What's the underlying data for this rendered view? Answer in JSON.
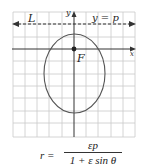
{
  "diagram": {
    "type": "conic-polar-ellipse",
    "labels": {
      "directrix": "L",
      "directrix_equation": "y = p",
      "y_axis": "y",
      "x_axis": "x",
      "focus": "F"
    },
    "formula": {
      "lhs": "r =",
      "numerator": "εp",
      "denominator": "1 + ε sin θ"
    },
    "colors": {
      "grid": "#c8c8c8",
      "axes": "#333333",
      "curve": "#555555",
      "dashed": "#333333"
    }
  }
}
